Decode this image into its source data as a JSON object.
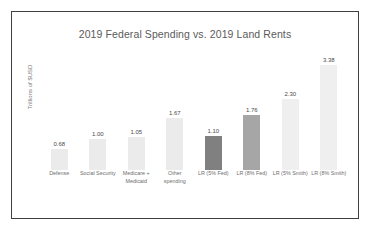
{
  "chart_data": {
    "type": "bar",
    "title": "2019 Federal Spending vs. 2019 Land Rents",
    "xlabel": "",
    "ylabel": "Trillions of $USD",
    "ylim": [
      0,
      3.8
    ],
    "grid": false,
    "legend": "none",
    "categories": [
      "Defense",
      "Social Security",
      "Medicare + Medicaid",
      "Other spending",
      "LR (5% Fed)",
      "LR (8% Fed)",
      "LR (5% Smith)",
      "LR (8% Smith)"
    ],
    "values": [
      0.68,
      1.0,
      1.05,
      1.67,
      1.1,
      1.76,
      2.3,
      3.38
    ],
    "value_labels": [
      "0.68",
      "1.00",
      "1.05",
      "1.67",
      "1.10",
      "1.76",
      "2.30",
      "3.38"
    ],
    "bar_colors": [
      "#ebebeb",
      "#ebebeb",
      "#ebebeb",
      "#ebebeb",
      "#808080",
      "#a6a6a6",
      "#efefef",
      "#efefef"
    ]
  },
  "frame": {
    "border_color": "#3f3f3f",
    "background": "#ffffff"
  }
}
